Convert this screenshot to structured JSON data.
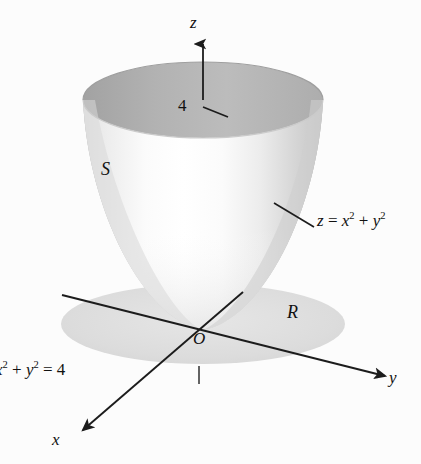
{
  "figure": {
    "background_color": "#fcfcfc"
  },
  "axes": {
    "z": {
      "label": "z",
      "direction": "up",
      "arrow": true
    },
    "y": {
      "label": "y",
      "direction": "down-right",
      "arrow": true
    },
    "x": {
      "label": "x",
      "direction": "down-left",
      "arrow": true
    },
    "origin_label": "O"
  },
  "ticks": {
    "z_tick": {
      "value": "4",
      "axis": "z"
    }
  },
  "labels": {
    "surface_name": "S",
    "region_name": "R",
    "surface_equation_lhs": "z",
    "surface_equation_op": " = ",
    "surface_equation_x": "x",
    "surface_equation_xexp": "2",
    "surface_equation_plus": " + ",
    "surface_equation_y": "y",
    "surface_equation_yexp": "2",
    "boundary_x": "x",
    "boundary_xexp": "2",
    "boundary_plus": " + ",
    "boundary_y": "y",
    "boundary_yexp": "2",
    "boundary_eq": " = 4"
  },
  "colors": {
    "outer_surface_light": "#f4f4f4",
    "outer_surface_mid": "#d8d8d8",
    "outer_surface_dark": "#c2c2c2",
    "inner_surface": "#b4b4b4",
    "inner_surface_dark": "#a6a6a6",
    "disk_fill": "#dcdcdc",
    "axis_line": "#1c1c1c",
    "text": "#111111"
  },
  "geometry": {
    "rim_center_x": 203,
    "rim_center_y": 100,
    "rim_radius_x": 120,
    "rim_radius_y": 38,
    "vertex_x": 203,
    "vertex_y": 330,
    "disk_center_x": 203,
    "disk_center_y": 324,
    "disk_radius_x": 142,
    "disk_radius_y": 40
  }
}
